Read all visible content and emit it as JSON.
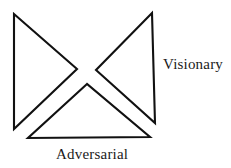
{
  "figure": {
    "title": "",
    "background_color": "#ffffff",
    "stroke_color": "#111111",
    "text_color": "#1a1a1a",
    "width": 231,
    "height": 168,
    "style": "hand-drawn line diagram, three overlapping triangles forming a bowtie with a lower triangle"
  },
  "shapes": [
    {
      "name": "left-triangle",
      "orientation": "points-right",
      "points": "14,14 14,129 77,69"
    },
    {
      "name": "right-triangle",
      "orientation": "points-left",
      "points": "152,13 155,123 96,70"
    },
    {
      "name": "bottom-triangle",
      "orientation": "points-up",
      "points": "87,84 28,138 150,137"
    }
  ],
  "labels": {
    "visionary": "Visionary",
    "adversarial": "Adversarial"
  }
}
